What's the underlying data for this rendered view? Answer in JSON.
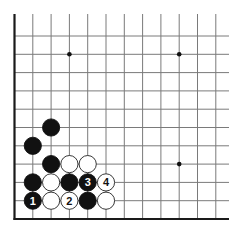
{
  "diagram": {
    "type": "go-board-corner",
    "corner": "bottom-left",
    "columns": 12,
    "rows": 11,
    "colors": {
      "background": "#ffffff",
      "grid_line": "#7a7a7a",
      "edge_line": "#1a1a1a",
      "black_stone": "#111111",
      "white_stone": "#ffffff",
      "white_stone_outline": "#222222",
      "hoshi": "#111111"
    },
    "hoshi": [
      {
        "col": 3,
        "row": 9
      },
      {
        "col": 9,
        "row": 9
      },
      {
        "col": 9,
        "row": 3
      }
    ],
    "stones": [
      {
        "color": "black",
        "col": 2,
        "row": 5,
        "label": ""
      },
      {
        "color": "black",
        "col": 1,
        "row": 4,
        "label": ""
      },
      {
        "color": "black",
        "col": 2,
        "row": 3,
        "label": ""
      },
      {
        "color": "white",
        "col": 3,
        "row": 3,
        "label": ""
      },
      {
        "color": "white",
        "col": 4,
        "row": 3,
        "label": ""
      },
      {
        "color": "black",
        "col": 1,
        "row": 2,
        "label": ""
      },
      {
        "color": "white",
        "col": 2,
        "row": 2,
        "label": ""
      },
      {
        "color": "black",
        "col": 3,
        "row": 2,
        "label": ""
      },
      {
        "color": "black",
        "col": 4,
        "row": 2,
        "label": "3"
      },
      {
        "color": "white",
        "col": 5,
        "row": 2,
        "label": "4"
      },
      {
        "color": "black",
        "col": 1,
        "row": 1,
        "label": "1"
      },
      {
        "color": "white",
        "col": 2,
        "row": 1,
        "label": ""
      },
      {
        "color": "white",
        "col": 3,
        "row": 1,
        "label": "2"
      },
      {
        "color": "black",
        "col": 4,
        "row": 1,
        "label": ""
      },
      {
        "color": "white",
        "col": 5,
        "row": 1,
        "label": ""
      }
    ]
  }
}
